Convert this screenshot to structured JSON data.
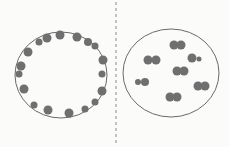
{
  "colors": {
    "background": "#fbfbf9",
    "outline": "#6a6a6a",
    "dot": "#6f6f6f",
    "divider": "#8a8a8a"
  },
  "divider": {
    "x": 116,
    "dash": "3,3"
  },
  "left_cell": {
    "ellipse": {
      "cx": 61,
      "cy": 75,
      "rx": 46,
      "ry": 43
    },
    "dots": [
      {
        "x": 60,
        "y": 35,
        "r": 4.5
      },
      {
        "x": 77,
        "y": 37,
        "r": 4.5
      },
      {
        "x": 47,
        "y": 38,
        "r": 4.5
      },
      {
        "x": 39,
        "y": 42,
        "r": 3.5
      },
      {
        "x": 88,
        "y": 42,
        "r": 4
      },
      {
        "x": 95,
        "y": 46,
        "r": 3.5
      },
      {
        "x": 28,
        "y": 52,
        "r": 4.5
      },
      {
        "x": 103,
        "y": 60,
        "r": 4.5
      },
      {
        "x": 21,
        "y": 66,
        "r": 4.5
      },
      {
        "x": 19,
        "y": 74,
        "r": 3.5
      },
      {
        "x": 102,
        "y": 74,
        "r": 3.5
      },
      {
        "x": 24,
        "y": 89,
        "r": 4.5
      },
      {
        "x": 102,
        "y": 91,
        "r": 4.5
      },
      {
        "x": 95,
        "y": 102,
        "r": 3.5
      },
      {
        "x": 34,
        "y": 105,
        "r": 3.5
      },
      {
        "x": 85,
        "y": 109,
        "r": 3.5
      },
      {
        "x": 48,
        "y": 110,
        "r": 4.5
      },
      {
        "x": 69,
        "y": 113,
        "r": 4.5
      }
    ]
  },
  "right_cell": {
    "ellipse": {
      "cx": 171,
      "cy": 73,
      "rx": 48,
      "ry": 44
    },
    "dots": [
      {
        "x": 174,
        "y": 45,
        "r": 4.5
      },
      {
        "x": 181,
        "y": 45,
        "r": 4.5
      },
      {
        "x": 148,
        "y": 60,
        "r": 4.5
      },
      {
        "x": 156,
        "y": 60,
        "r": 4.5
      },
      {
        "x": 192,
        "y": 58,
        "r": 4.5
      },
      {
        "x": 199,
        "y": 59,
        "r": 2.5
      },
      {
        "x": 177,
        "y": 71,
        "r": 4.5
      },
      {
        "x": 184,
        "y": 71,
        "r": 4.5
      },
      {
        "x": 138,
        "y": 82,
        "r": 3
      },
      {
        "x": 145,
        "y": 82,
        "r": 4
      },
      {
        "x": 198,
        "y": 86,
        "r": 4.5
      },
      {
        "x": 205,
        "y": 86,
        "r": 4.5
      },
      {
        "x": 170,
        "y": 97,
        "r": 4.5
      },
      {
        "x": 177,
        "y": 97,
        "r": 4.5
      }
    ]
  }
}
